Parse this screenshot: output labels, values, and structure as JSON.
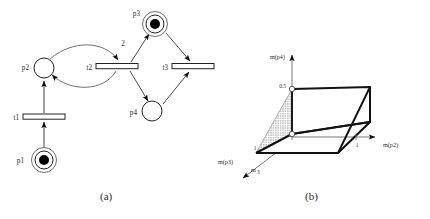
{
  "figure": {
    "captions": [
      {
        "id": "a",
        "text": "(a)"
      },
      {
        "id": "b",
        "text": "(b)"
      }
    ]
  },
  "panel_a": {
    "title": "petri-net",
    "places": [
      {
        "id": "p1",
        "label": "p1",
        "cx": 44,
        "cy": 160,
        "r": 9,
        "double_ring": true,
        "outer_r": 12.5,
        "tokens": 1,
        "label_x": 24,
        "label_y": 163
      },
      {
        "id": "p2",
        "label": "p2",
        "cx": 44,
        "cy": 68,
        "r": 10,
        "double_ring": false,
        "tokens": 0,
        "label_x": 22,
        "label_y": 70
      },
      {
        "id": "p3",
        "label": "p3",
        "cx": 155,
        "cy": 24,
        "r": 9,
        "double_ring": true,
        "outer_r": 12.5,
        "tokens": 1,
        "label_x": 135,
        "label_y": 18
      },
      {
        "id": "p4",
        "label": "p4",
        "cx": 152,
        "cy": 111,
        "r": 10,
        "double_ring": false,
        "tokens": 0,
        "label_x": 131,
        "label_y": 116
      }
    ],
    "transitions": [
      {
        "id": "t1",
        "label": "t1",
        "x": 23,
        "y": 114,
        "w": 42,
        "h": 5,
        "label_x": 14,
        "label_y": 119
      },
      {
        "id": "t2",
        "label": "t2",
        "x": 96,
        "y": 64,
        "w": 42,
        "h": 5,
        "label_x": 86,
        "label_y": 69
      },
      {
        "id": "t3",
        "label": "t3",
        "x": 172,
        "y": 64,
        "w": 42,
        "h": 5,
        "label_x": 163,
        "label_y": 69
      }
    ],
    "arc_weights": [
      {
        "value": "2",
        "x": 123,
        "y": 44
      }
    ],
    "arc_list": [
      {
        "from": "p1",
        "to": "t1"
      },
      {
        "from": "t1",
        "to": "p2"
      },
      {
        "from": "p2",
        "to": "t2",
        "curved": true
      },
      {
        "from": "t2",
        "to": "p2",
        "curved": true
      },
      {
        "from": "t2",
        "to": "p3",
        "weight": "2"
      },
      {
        "from": "t2",
        "to": "p4"
      },
      {
        "from": "p3",
        "to": "t3"
      },
      {
        "from": "p4",
        "to": "t3"
      }
    ]
  },
  "panel_b": {
    "title": "reachability-polytope",
    "axes": [
      {
        "id": "mp4",
        "label": "m(p4)",
        "label_x": 56,
        "label_y": 58,
        "orientation": "vertical-up"
      },
      {
        "id": "mp2",
        "label": "m(p2)",
        "label_x": 168,
        "label_y": 148,
        "orientation": "horizontal-right"
      },
      {
        "id": "mp3",
        "label": "m(p3)",
        "label_x": 3,
        "label_y": 162,
        "orientation": "diagonal-down-left"
      }
    ],
    "origin_label": {
      "text": "m",
      "sub": "3",
      "x": 38,
      "y": 170
    },
    "ticks": [
      {
        "axis": "mp4",
        "value": "0.5",
        "x": 60,
        "y": 86
      },
      {
        "axis": "mp2",
        "value": "1",
        "x": 158,
        "y": 144
      },
      {
        "axis": "mp3",
        "value": "1",
        "x": 41,
        "y": 153
      }
    ],
    "vertex_markers": [
      {
        "x": 77,
        "y": 89,
        "r": 2.6,
        "label": "0.5-vertex"
      },
      {
        "x": 77,
        "y": 134,
        "r": 2.6,
        "label": "base-vertex"
      }
    ],
    "shaded_region": {
      "fill": "#8c8c8c",
      "pattern": "dotted",
      "description": "shaded triangular face"
    },
    "stroke_color": "#000000"
  }
}
